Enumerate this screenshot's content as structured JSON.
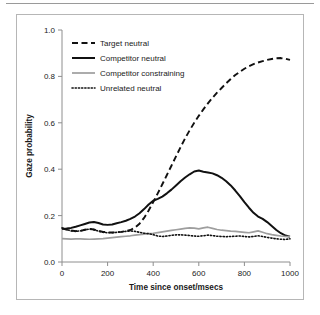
{
  "figure": {
    "background_color": "#ffffff",
    "border_color": "#b6b6b6",
    "rule_color": "#9a9a9a"
  },
  "chart_data": {
    "type": "line",
    "title": "",
    "xlabel": "Time since onset/msecs",
    "ylabel": "Gaze probability",
    "xlim": [
      0,
      1000
    ],
    "ylim": [
      0.0,
      1.0
    ],
    "xticks": [
      0,
      200,
      400,
      600,
      800,
      1000
    ],
    "xtick_labels": [
      "0",
      "200",
      "400",
      "600",
      "800",
      "1000"
    ],
    "yticks": [
      0.0,
      0.2,
      0.4,
      0.6,
      0.8,
      1.0
    ],
    "ytick_labels": [
      "0.0",
      "0.2",
      "0.4",
      "0.6",
      "0.8",
      "1.0"
    ],
    "grid": false,
    "legend_position": "upper left",
    "x": [
      0,
      20,
      40,
      60,
      80,
      100,
      120,
      140,
      160,
      180,
      200,
      220,
      240,
      260,
      280,
      300,
      320,
      340,
      360,
      380,
      400,
      420,
      440,
      460,
      480,
      500,
      520,
      540,
      560,
      580,
      600,
      620,
      640,
      660,
      680,
      700,
      720,
      740,
      760,
      780,
      800,
      820,
      840,
      860,
      880,
      900,
      920,
      940,
      960,
      980,
      1000
    ],
    "series": [
      {
        "name": "Target neutral",
        "style": "dashed",
        "color": "#111111",
        "width": 1.9,
        "values": [
          0.145,
          0.14,
          0.136,
          0.133,
          0.134,
          0.139,
          0.143,
          0.14,
          0.134,
          0.13,
          0.128,
          0.127,
          0.128,
          0.13,
          0.133,
          0.138,
          0.148,
          0.165,
          0.19,
          0.222,
          0.258,
          0.296,
          0.335,
          0.375,
          0.415,
          0.455,
          0.495,
          0.533,
          0.568,
          0.6,
          0.63,
          0.658,
          0.684,
          0.708,
          0.73,
          0.75,
          0.77,
          0.789,
          0.806,
          0.82,
          0.833,
          0.844,
          0.853,
          0.86,
          0.866,
          0.871,
          0.875,
          0.878,
          0.879,
          0.876,
          0.871
        ]
      },
      {
        "name": "Competitor neutral",
        "style": "solid",
        "color": "#111111",
        "width": 2.0,
        "values": [
          0.143,
          0.144,
          0.147,
          0.152,
          0.158,
          0.164,
          0.17,
          0.172,
          0.168,
          0.162,
          0.16,
          0.162,
          0.167,
          0.172,
          0.178,
          0.186,
          0.196,
          0.21,
          0.228,
          0.248,
          0.264,
          0.272,
          0.282,
          0.296,
          0.312,
          0.33,
          0.348,
          0.364,
          0.378,
          0.39,
          0.394,
          0.389,
          0.386,
          0.382,
          0.374,
          0.363,
          0.348,
          0.33,
          0.308,
          0.284,
          0.258,
          0.234,
          0.212,
          0.196,
          0.186,
          0.172,
          0.155,
          0.138,
          0.124,
          0.114,
          0.109
        ]
      },
      {
        "name": "Competitor constraining",
        "style": "solid",
        "color": "#9e9e9e",
        "width": 1.7,
        "values": [
          0.101,
          0.1,
          0.099,
          0.1,
          0.1,
          0.099,
          0.098,
          0.099,
          0.1,
          0.101,
          0.103,
          0.105,
          0.107,
          0.109,
          0.111,
          0.113,
          0.116,
          0.118,
          0.12,
          0.122,
          0.124,
          0.127,
          0.13,
          0.133,
          0.136,
          0.139,
          0.142,
          0.145,
          0.147,
          0.146,
          0.143,
          0.147,
          0.15,
          0.145,
          0.14,
          0.137,
          0.135,
          0.133,
          0.132,
          0.13,
          0.128,
          0.126,
          0.13,
          0.134,
          0.128,
          0.122,
          0.118,
          0.115,
          0.112,
          0.11,
          0.109
        ]
      },
      {
        "name": "Unrelated neutral",
        "style": "dotted",
        "color": "#111111",
        "width": 1.6,
        "values": [
          0.147,
          0.14,
          0.134,
          0.132,
          0.134,
          0.138,
          0.142,
          0.139,
          0.133,
          0.128,
          0.126,
          0.126,
          0.128,
          0.13,
          0.132,
          0.134,
          0.132,
          0.128,
          0.124,
          0.122,
          0.118,
          0.112,
          0.11,
          0.112,
          0.115,
          0.117,
          0.117,
          0.116,
          0.114,
          0.112,
          0.111,
          0.113,
          0.116,
          0.114,
          0.111,
          0.11,
          0.109,
          0.11,
          0.111,
          0.112,
          0.11,
          0.108,
          0.11,
          0.113,
          0.11,
          0.106,
          0.103,
          0.1,
          0.098,
          0.097,
          0.1
        ]
      }
    ]
  }
}
